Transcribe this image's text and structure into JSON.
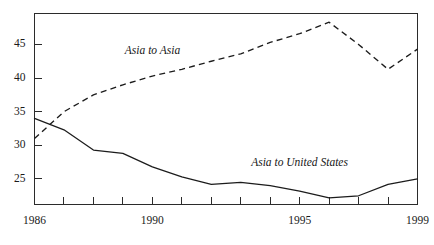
{
  "chart_data": {
    "type": "line",
    "title": "",
    "subtitle": "",
    "xlabel": "",
    "ylabel": "",
    "xlim": [
      1986,
      1999
    ],
    "ylim": [
      21.2,
      49.6
    ],
    "grid": false,
    "legend_position": "inline-annotation",
    "x": [
      1986,
      1987,
      1988,
      1989,
      1990,
      1991,
      1992,
      1993,
      1994,
      1995,
      1996,
      1997,
      1998,
      1999
    ],
    "xtick_values": [
      1986,
      1987,
      1988,
      1989,
      1990,
      1991,
      1992,
      1993,
      1994,
      1995,
      1996,
      1997,
      1998,
      1999
    ],
    "xtick_labels_shown": [
      "1986",
      "1990",
      "1995",
      "1999"
    ],
    "xtick_labels_shown_values": [
      1986,
      1990,
      1995,
      1999
    ],
    "ytick_values": [
      25,
      30,
      35,
      40,
      45
    ],
    "ytick_labels": [
      "25",
      "30",
      "35",
      "40",
      "45"
    ],
    "series": [
      {
        "name": "Asia to Asia",
        "style": "dashed",
        "label_x": 1990.0,
        "label_y": 43.9,
        "values": [
          31.0,
          35.0,
          37.5,
          39.0,
          40.3,
          41.3,
          42.5,
          43.6,
          45.3,
          46.6,
          48.3,
          45.0,
          41.3,
          44.3
        ]
      },
      {
        "name": "Asia to United States",
        "style": "solid",
        "label_x": 1995.0,
        "label_y": 27.2,
        "values": [
          34.0,
          32.3,
          29.3,
          28.8,
          26.8,
          25.3,
          24.2,
          24.5,
          24.0,
          23.2,
          22.2,
          22.5,
          24.2,
          25.0
        ]
      }
    ]
  },
  "labels": {
    "series_asia_to_asia": "Asia to Asia",
    "series_asia_to_us": "Asia to United States"
  },
  "colors": {
    "axis": "#2b2b2b",
    "line": "#1c1c1c",
    "background": "#ffffff",
    "text": "#1a1a1a"
  }
}
